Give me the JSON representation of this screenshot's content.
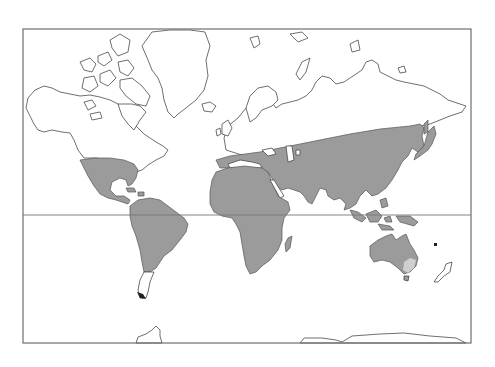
{
  "map": {
    "projection": "Mercator world map",
    "frame": {
      "x": 23,
      "y": 29,
      "width": 448,
      "height": 314,
      "stroke": "#6e6e6e"
    },
    "equator_line": {
      "y": 215,
      "stroke": "#777777"
    },
    "colors": {
      "background": "#ffffff",
      "land_outline": "#4a4a4a",
      "distribution_fill": "#9b9b9b",
      "distribution_light": "#cfcfcf"
    },
    "legend": null,
    "regions_shaded": [
      {
        "id": "north-america-south",
        "label": "Southern USA, Mexico, Central America, Caribbean"
      },
      {
        "id": "south-america",
        "label": "South America (north of Patagonia)"
      },
      {
        "id": "eurasia-south",
        "label": "Southern Europe, Middle East, southern & eastern Asia, Japan"
      },
      {
        "id": "africa",
        "label": "Africa and Madagascar"
      },
      {
        "id": "southeast-asia",
        "label": "Indonesia, Philippines, New Guinea"
      },
      {
        "id": "australia",
        "label": "Australia (except south-east corner)"
      }
    ],
    "regions_unshaded": [
      {
        "id": "north-america-north",
        "label": "Canada, Alaska, Greenland, Arctic islands"
      },
      {
        "id": "patagonia",
        "label": "Southern South America"
      },
      {
        "id": "northern-eurasia",
        "label": "Northern Europe, Scandinavia, Siberia"
      },
      {
        "id": "new-zealand",
        "label": "New Zealand"
      },
      {
        "id": "antarctica",
        "label": "Antarctica"
      }
    ]
  }
}
